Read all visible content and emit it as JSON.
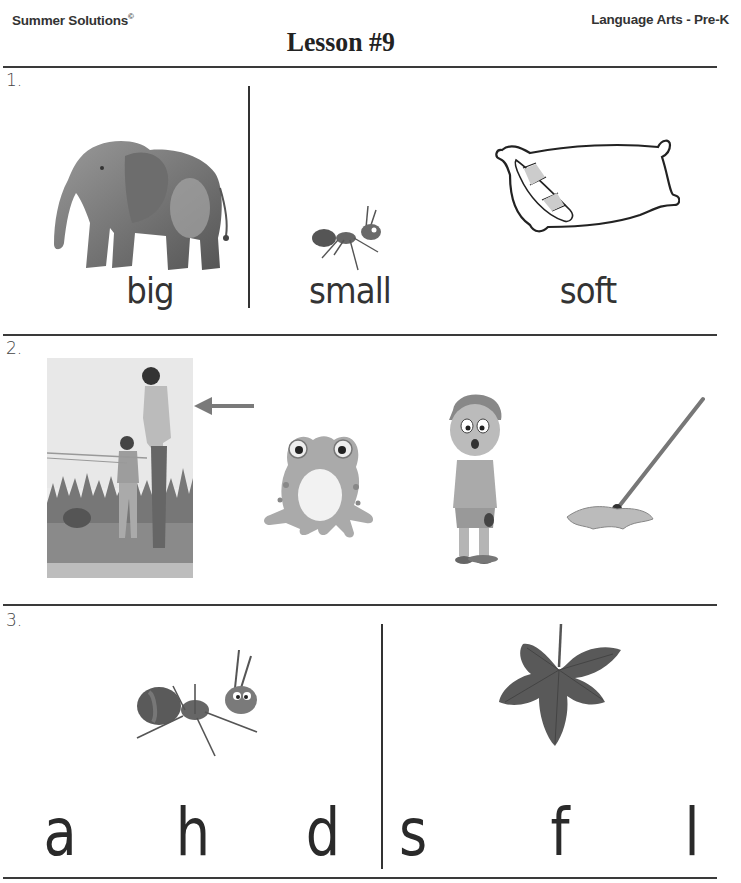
{
  "header": {
    "publisher": "Summer Solutions",
    "publisher_mark": "©",
    "title": "Lesson #9",
    "subject": "Language Arts - Pre-K"
  },
  "sections": [
    {
      "number": "1.",
      "items": [
        {
          "picture": "elephant-image",
          "word": "big"
        },
        {
          "picture": "ant-image",
          "word": "small"
        },
        {
          "picture": "pillow-image",
          "word": "soft"
        }
      ]
    },
    {
      "number": "2.",
      "items": [
        {
          "picture": "father-son-fishing-image",
          "marker": "arrow-left-icon"
        },
        {
          "picture": "frog-image"
        },
        {
          "picture": "crying-boy-image"
        },
        {
          "picture": "mop-image"
        }
      ]
    },
    {
      "number": "3.",
      "groups": [
        {
          "picture": "ant-image",
          "letters": [
            "a",
            "h",
            "d"
          ]
        },
        {
          "picture": "leaf-image",
          "letters": [
            "s",
            "f",
            "l"
          ]
        }
      ]
    }
  ],
  "colors": {
    "rule": "#3a3a3a",
    "text": "#2b2b2b",
    "arrow": "#7a7a7a"
  }
}
